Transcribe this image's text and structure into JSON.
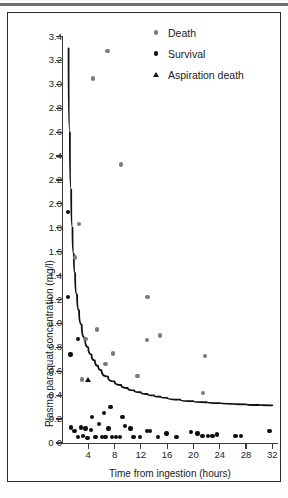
{
  "figure": {
    "legend": [
      {
        "label": "Death",
        "marker": "death-dot",
        "color": "#7a7a7a"
      },
      {
        "label": "Survival",
        "marker": "survival-dot",
        "color": "#0d0d0d"
      },
      {
        "label": "Aspiration death",
        "marker": "aspiration-triangle",
        "color": "#0d0d0d"
      }
    ]
  },
  "chart_data": {
    "type": "scatter",
    "title": "",
    "xlabel": "Time from ingestion (hours)",
    "ylabel": "Plasma paraquat concentration (mg/l)",
    "xlim": [
      0,
      32.8
    ],
    "ylim": [
      0,
      3.4
    ],
    "xticks": [
      0,
      4,
      8,
      12,
      16,
      20,
      24,
      28,
      32
    ],
    "xticklabels": [
      "0",
      "4",
      "8",
      "12",
      "16",
      "20",
      "24",
      "28",
      "32"
    ],
    "yticks": [
      0,
      0.2,
      0.4,
      0.6,
      0.8,
      1.0,
      1.2,
      1.4,
      1.6,
      1.8,
      2.0,
      2.2,
      2.4,
      2.6,
      2.8,
      3.0,
      3.2,
      3.4
    ],
    "yticklabels": [
      "0",
      "0.2",
      "0.4",
      "0.6",
      "0.8",
      "1.0",
      "1.2",
      "1.4",
      "1.6",
      "1.8",
      "2.0",
      "2.2",
      "2.4",
      "2.6",
      "2.8",
      "3.0",
      "3.2",
      "3.4"
    ],
    "grid": false,
    "legend_position": "top-right",
    "series": [
      {
        "name": "Death",
        "marker": "circle",
        "color": "#7a7a7a",
        "points": [
          [
            6.9,
            3.28
          ],
          [
            4.7,
            3.05
          ],
          [
            9.0,
            2.33
          ],
          [
            2.6,
            1.83
          ],
          [
            2.0,
            1.55
          ],
          [
            13.0,
            1.22
          ],
          [
            5.3,
            0.95
          ],
          [
            14.9,
            0.9
          ],
          [
            12.9,
            0.86
          ],
          [
            3.6,
            0.87
          ],
          [
            7.8,
            0.75
          ],
          [
            21.8,
            0.73
          ],
          [
            6.6,
            0.66
          ],
          [
            11.5,
            0.56
          ],
          [
            3.0,
            0.53
          ],
          [
            21.5,
            0.42
          ]
        ]
      },
      {
        "name": "Survival",
        "marker": "circle",
        "color": "#0d0d0d",
        "points": [
          [
            0.9,
            1.93
          ],
          [
            0.9,
            1.22
          ],
          [
            1.3,
            0.74
          ],
          [
            2.4,
            0.87
          ],
          [
            4.6,
            0.22
          ],
          [
            6.4,
            0.25
          ],
          [
            7.4,
            0.3
          ],
          [
            9.2,
            0.22
          ],
          [
            10.4,
            0.12
          ],
          [
            1.4,
            0.13
          ],
          [
            1.9,
            0.1
          ],
          [
            2.4,
            0.05
          ],
          [
            2.9,
            0.13
          ],
          [
            3.2,
            0.06
          ],
          [
            3.6,
            0.12
          ],
          [
            3.9,
            0.04
          ],
          [
            4.4,
            0.11
          ],
          [
            5.1,
            0.05
          ],
          [
            5.6,
            0.16
          ],
          [
            6.1,
            0.05
          ],
          [
            6.6,
            0.05
          ],
          [
            7.1,
            0.12
          ],
          [
            7.6,
            0.05
          ],
          [
            8.2,
            0.05
          ],
          [
            8.8,
            0.05
          ],
          [
            9.6,
            0.14
          ],
          [
            10.9,
            0.05
          ],
          [
            11.9,
            0.05
          ],
          [
            12.9,
            0.1
          ],
          [
            13.4,
            0.1
          ],
          [
            14.6,
            0.05
          ],
          [
            15.9,
            0.08
          ],
          [
            17.4,
            0.05
          ],
          [
            19.6,
            0.09
          ],
          [
            20.6,
            0.08
          ],
          [
            21.4,
            0.06
          ],
          [
            22.2,
            0.06
          ],
          [
            22.9,
            0.06
          ],
          [
            23.6,
            0.07
          ],
          [
            26.4,
            0.06
          ],
          [
            27.2,
            0.06
          ],
          [
            31.6,
            0.1
          ]
        ]
      },
      {
        "name": "Aspiration death",
        "marker": "triangle",
        "color": "#0d0d0d",
        "points": [
          [
            4.0,
            0.53
          ]
        ]
      }
    ],
    "curve": {
      "name": "prognostic survival curve",
      "color": "#111111",
      "points": [
        [
          1.0,
          3.3
        ],
        [
          1.2,
          2.6
        ],
        [
          1.4,
          2.12
        ],
        [
          1.6,
          1.8
        ],
        [
          1.8,
          1.58
        ],
        [
          2.0,
          1.42
        ],
        [
          2.3,
          1.24
        ],
        [
          2.6,
          1.11
        ],
        [
          3.0,
          0.99
        ],
        [
          3.5,
          0.88
        ],
        [
          4.0,
          0.8
        ],
        [
          4.5,
          0.74
        ],
        [
          5.0,
          0.69
        ],
        [
          5.5,
          0.645
        ],
        [
          6.0,
          0.61
        ],
        [
          7.0,
          0.555
        ],
        [
          8.0,
          0.515
        ],
        [
          9.0,
          0.485
        ],
        [
          10.0,
          0.46
        ],
        [
          11.0,
          0.44
        ],
        [
          12.0,
          0.425
        ],
        [
          13.0,
          0.41
        ],
        [
          14.0,
          0.398
        ],
        [
          15.0,
          0.387
        ],
        [
          16.0,
          0.378
        ],
        [
          18.0,
          0.362
        ],
        [
          20.0,
          0.35
        ],
        [
          22.0,
          0.341
        ],
        [
          24.0,
          0.334
        ],
        [
          26.0,
          0.328
        ],
        [
          28.0,
          0.323
        ],
        [
          30.0,
          0.318
        ],
        [
          32.0,
          0.315
        ]
      ]
    }
  }
}
